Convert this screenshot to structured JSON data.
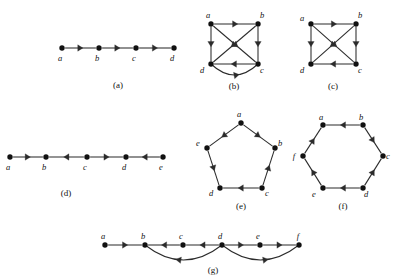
{
  "figure": {
    "background_color": "#ffffff",
    "ink_color": "#111111",
    "edge_color": "#2b2b2b",
    "panels": [
      {
        "key": "a",
        "caption": "(a)",
        "layout": "path",
        "vertices": [
          {
            "id": "a",
            "label": "a",
            "x": 62,
            "y": 48,
            "label_dx": -2,
            "label_dy": 13
          },
          {
            "id": "b",
            "label": "b",
            "x": 99,
            "y": 48,
            "label_dx": -2,
            "label_dy": 13
          },
          {
            "id": "c",
            "label": "c",
            "x": 136,
            "y": 48,
            "label_dx": -2,
            "label_dy": 13
          },
          {
            "id": "d",
            "label": "d",
            "x": 174,
            "y": 48,
            "label_dx": -2,
            "label_dy": 13
          }
        ],
        "edges": [
          {
            "from": "a",
            "to": "b",
            "type": "straight"
          },
          {
            "from": "b",
            "to": "c",
            "type": "straight"
          },
          {
            "from": "c",
            "to": "d",
            "type": "straight"
          }
        ]
      },
      {
        "key": "b",
        "caption": "(b)",
        "layout": "square-with-diagonals",
        "vertices": [
          {
            "id": "a",
            "label": "a",
            "x": 211,
            "y": 24,
            "label_dx": -3,
            "label_dy": -6
          },
          {
            "id": "b",
            "label": "b",
            "x": 258,
            "y": 24,
            "label_dx": 4,
            "label_dy": -6
          },
          {
            "id": "c",
            "label": "c",
            "x": 258,
            "y": 64,
            "label_dx": 4,
            "label_dy": 9
          },
          {
            "id": "d",
            "label": "d",
            "x": 211,
            "y": 64,
            "label_dx": -9,
            "label_dy": 9
          }
        ],
        "edges": [
          {
            "from": "a",
            "to": "b",
            "type": "straight"
          },
          {
            "from": "a",
            "to": "d",
            "type": "straight"
          },
          {
            "from": "b",
            "to": "c",
            "type": "straight"
          },
          {
            "from": "a",
            "to": "c",
            "type": "straight"
          },
          {
            "from": "b",
            "to": "d",
            "type": "straight"
          },
          {
            "from": "c",
            "to": "d",
            "type": "straight"
          },
          {
            "from": "d",
            "to": "c",
            "type": "curved",
            "bow": 11
          }
        ]
      },
      {
        "key": "c",
        "caption": "(c)",
        "layout": "square-with-diagonals",
        "vertices": [
          {
            "id": "a",
            "label": "a",
            "x": 311,
            "y": 24,
            "label_dx": -9,
            "label_dy": -3
          },
          {
            "id": "b",
            "label": "b",
            "x": 356,
            "y": 24,
            "label_dx": 4,
            "label_dy": -6
          },
          {
            "id": "c",
            "label": "c",
            "x": 356,
            "y": 64,
            "label_dx": 4,
            "label_dy": 9
          },
          {
            "id": "d",
            "label": "d",
            "x": 311,
            "y": 64,
            "label_dx": -9,
            "label_dy": 9
          }
        ],
        "edges": [
          {
            "from": "a",
            "to": "b",
            "type": "straight"
          },
          {
            "from": "a",
            "to": "d",
            "type": "straight"
          },
          {
            "from": "b",
            "to": "c",
            "type": "straight"
          },
          {
            "from": "a",
            "to": "c",
            "type": "straight"
          },
          {
            "from": "b",
            "to": "d",
            "type": "straight"
          },
          {
            "from": "c",
            "to": "d",
            "type": "straight"
          }
        ]
      },
      {
        "key": "d",
        "caption": "(d)",
        "layout": "path",
        "vertices": [
          {
            "id": "a",
            "label": "a",
            "x": 10,
            "y": 157,
            "label_dx": -2,
            "label_dy": 13
          },
          {
            "id": "b",
            "label": "b",
            "x": 46,
            "y": 157,
            "label_dx": -2,
            "label_dy": 13
          },
          {
            "id": "c",
            "label": "c",
            "x": 87,
            "y": 157,
            "label_dx": -2,
            "label_dy": 13
          },
          {
            "id": "d",
            "label": "d",
            "x": 126,
            "y": 157,
            "label_dx": -2,
            "label_dy": 13
          },
          {
            "id": "e",
            "label": "e",
            "x": 163,
            "y": 157,
            "label_dx": -2,
            "label_dy": 13
          }
        ],
        "edges": [
          {
            "from": "a",
            "to": "b",
            "type": "straight"
          },
          {
            "from": "c",
            "to": "b",
            "type": "straight"
          },
          {
            "from": "c",
            "to": "d",
            "type": "straight"
          },
          {
            "from": "e",
            "to": "d",
            "type": "straight"
          }
        ]
      },
      {
        "key": "e",
        "caption": "(e)",
        "layout": "pentagon",
        "vertices": [
          {
            "id": "a",
            "label": "a",
            "x": 241,
            "y": 123,
            "label_dx": -2,
            "label_dy": -6
          },
          {
            "id": "b",
            "label": "b",
            "x": 275,
            "y": 148,
            "label_dx": 5,
            "label_dy": -2
          },
          {
            "id": "c",
            "label": "c",
            "x": 262,
            "y": 188,
            "label_dx": 5,
            "label_dy": 8
          },
          {
            "id": "d",
            "label": "d",
            "x": 220,
            "y": 188,
            "label_dx": -9,
            "label_dy": 8
          },
          {
            "id": "e",
            "label": "e",
            "x": 207,
            "y": 148,
            "label_dx": -9,
            "label_dy": -2
          }
        ],
        "edges": [
          {
            "from": "a",
            "to": "b",
            "type": "straight"
          },
          {
            "from": "a",
            "to": "e",
            "type": "straight"
          },
          {
            "from": "c",
            "to": "b",
            "type": "straight"
          },
          {
            "from": "c",
            "to": "d",
            "type": "straight"
          },
          {
            "from": "e",
            "to": "d",
            "type": "straight"
          }
        ]
      },
      {
        "key": "f",
        "caption": "(f)",
        "layout": "hexagon",
        "vertices": [
          {
            "id": "a",
            "label": "a",
            "x": 323,
            "y": 125,
            "label_dx": -2,
            "label_dy": -5
          },
          {
            "id": "b",
            "label": "b",
            "x": 363,
            "y": 125,
            "label_dx": -2,
            "label_dy": -5
          },
          {
            "id": "c",
            "label": "c",
            "x": 383,
            "y": 156,
            "label_dx": 5,
            "label_dy": 3
          },
          {
            "id": "d",
            "label": "d",
            "x": 363,
            "y": 188,
            "label_dx": 3,
            "label_dy": 9
          },
          {
            "id": "e",
            "label": "e",
            "x": 323,
            "y": 188,
            "label_dx": -9,
            "label_dy": 9
          },
          {
            "id": "f",
            "label": "f",
            "x": 303,
            "y": 156,
            "label_dx": -9,
            "label_dy": 3
          }
        ],
        "edges": [
          {
            "from": "b",
            "to": "a",
            "type": "straight"
          },
          {
            "from": "f",
            "to": "a",
            "type": "straight"
          },
          {
            "from": "e",
            "to": "f",
            "type": "straight"
          },
          {
            "from": "d",
            "to": "e",
            "type": "straight"
          },
          {
            "from": "d",
            "to": "c",
            "type": "straight"
          },
          {
            "from": "b",
            "to": "c",
            "type": "straight"
          }
        ]
      },
      {
        "key": "g",
        "caption": "(g)",
        "layout": "path-with-arcs",
        "vertices": [
          {
            "id": "a",
            "label": "a",
            "x": 105,
            "y": 245,
            "label_dx": -2,
            "label_dy": -6
          },
          {
            "id": "b",
            "label": "b",
            "x": 145,
            "y": 245,
            "label_dx": -2,
            "label_dy": -6
          },
          {
            "id": "c",
            "label": "c",
            "x": 183,
            "y": 245,
            "label_dx": -2,
            "label_dy": -6
          },
          {
            "id": "d",
            "label": "d",
            "x": 222,
            "y": 245,
            "label_dx": -2,
            "label_dy": -6
          },
          {
            "id": "e",
            "label": "e",
            "x": 260,
            "y": 245,
            "label_dx": -2,
            "label_dy": -6
          },
          {
            "id": "f",
            "label": "f",
            "x": 299,
            "y": 245,
            "label_dx": -1,
            "label_dy": -6
          }
        ],
        "edges": [
          {
            "from": "a",
            "to": "b",
            "type": "straight"
          },
          {
            "from": "c",
            "to": "b",
            "type": "straight"
          },
          {
            "from": "d",
            "to": "c",
            "type": "straight"
          },
          {
            "from": "d",
            "to": "e",
            "type": "straight"
          },
          {
            "from": "e",
            "to": "f",
            "type": "straight"
          },
          {
            "from": "d",
            "to": "b",
            "type": "arc-below",
            "bow": 15
          },
          {
            "from": "d",
            "to": "f",
            "type": "arc-below",
            "bow": 15
          }
        ]
      }
    ],
    "captions": [
      {
        "key": "a",
        "text": "(a)",
        "x": 118,
        "y": 88
      },
      {
        "key": "b",
        "text": "(b)",
        "x": 234,
        "y": 89
      },
      {
        "key": "c",
        "text": "(c)",
        "x": 333,
        "y": 89
      },
      {
        "key": "d",
        "text": "(d)",
        "x": 66,
        "y": 196
      },
      {
        "key": "e",
        "text": "(e)",
        "x": 241,
        "y": 209
      },
      {
        "key": "f",
        "text": "(f)",
        "x": 343,
        "y": 209
      },
      {
        "key": "g",
        "text": "(g)",
        "x": 213,
        "y": 273
      }
    ]
  }
}
